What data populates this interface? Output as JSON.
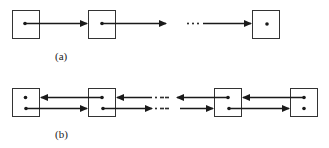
{
  "diagram": {
    "part_a": {
      "label": "(a)",
      "kind": "singly-linked-list",
      "nodes": 3,
      "ellipsis": "···"
    },
    "part_b": {
      "label": "(b)",
      "kind": "doubly-linked-list",
      "nodes": 4,
      "ellipsis": "···"
    },
    "colors": {
      "stroke": "#1a1a1a",
      "background": "#ffffff"
    }
  }
}
